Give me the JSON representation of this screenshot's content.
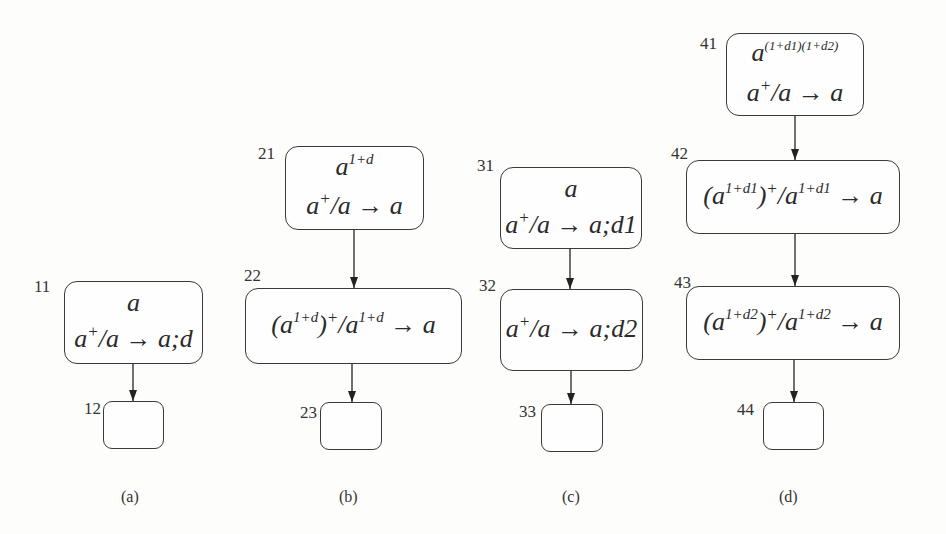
{
  "diagram": {
    "panels": [
      {
        "caption": "(a)",
        "nodes": [
          {
            "id": "11",
            "lines": [
              {
                "parts": [
                  {
                    "t": "a"
                  }
                ]
              },
              {
                "parts": [
                  {
                    "t": "a"
                  },
                  {
                    "sup": "+"
                  },
                  {
                    "t": "/a → a;d"
                  }
                ]
              }
            ]
          },
          {
            "id": "12",
            "lines": []
          }
        ],
        "edges": [
          [
            "11",
            "12"
          ]
        ]
      },
      {
        "caption": "(b)",
        "nodes": [
          {
            "id": "21",
            "lines": [
              {
                "parts": [
                  {
                    "t": "a"
                  },
                  {
                    "sup": "1+d"
                  }
                ]
              },
              {
                "parts": [
                  {
                    "t": "a"
                  },
                  {
                    "sup": "+"
                  },
                  {
                    "t": "/a → a"
                  }
                ]
              }
            ]
          },
          {
            "id": "22",
            "lines": [
              {
                "parts": [
                  {
                    "t": "(a"
                  },
                  {
                    "sup": "1+d"
                  },
                  {
                    "t": ")"
                  },
                  {
                    "sup": "+"
                  },
                  {
                    "t": "/a"
                  },
                  {
                    "sup": "1+d"
                  },
                  {
                    "t": " → a"
                  }
                ]
              }
            ]
          },
          {
            "id": "23",
            "lines": []
          }
        ],
        "edges": [
          [
            "21",
            "22"
          ],
          [
            "22",
            "23"
          ]
        ]
      },
      {
        "caption": "(c)",
        "nodes": [
          {
            "id": "31",
            "lines": [
              {
                "parts": [
                  {
                    "t": "a"
                  }
                ]
              },
              {
                "parts": [
                  {
                    "t": "a"
                  },
                  {
                    "sup": "+"
                  },
                  {
                    "t": "/a → a;d1"
                  }
                ]
              }
            ]
          },
          {
            "id": "32",
            "lines": [
              {
                "parts": [
                  {
                    "t": "a"
                  },
                  {
                    "sup": "+"
                  },
                  {
                    "t": "/a → a;d2"
                  }
                ]
              }
            ]
          },
          {
            "id": "33",
            "lines": []
          }
        ],
        "edges": [
          [
            "31",
            "32"
          ],
          [
            "32",
            "33"
          ]
        ]
      },
      {
        "caption": "(d)",
        "nodes": [
          {
            "id": "41",
            "lines": [
              {
                "parts": [
                  {
                    "t": "a"
                  },
                  {
                    "sup": "(1+d1)(1+d2)"
                  }
                ]
              },
              {
                "parts": [
                  {
                    "t": "a"
                  },
                  {
                    "sup": "+"
                  },
                  {
                    "t": "/a → a"
                  }
                ]
              }
            ]
          },
          {
            "id": "42",
            "lines": [
              {
                "parts": [
                  {
                    "t": "(a"
                  },
                  {
                    "sup": "1+d1"
                  },
                  {
                    "t": ")"
                  },
                  {
                    "sup": "+"
                  },
                  {
                    "t": "/a"
                  },
                  {
                    "sup": "1+d1"
                  },
                  {
                    "t": " → a"
                  }
                ]
              }
            ]
          },
          {
            "id": "43",
            "lines": [
              {
                "parts": [
                  {
                    "t": "(a"
                  },
                  {
                    "sup": "1+d2"
                  },
                  {
                    "t": ")"
                  },
                  {
                    "sup": "+"
                  },
                  {
                    "t": "/a"
                  },
                  {
                    "sup": "1+d2"
                  },
                  {
                    "t": " → a"
                  }
                ]
              }
            ]
          },
          {
            "id": "44",
            "lines": []
          }
        ],
        "edges": [
          [
            "41",
            "42"
          ],
          [
            "42",
            "43"
          ],
          [
            "43",
            "44"
          ]
        ]
      }
    ]
  },
  "labels": {
    "n11": "11",
    "n12": "12",
    "n21": "21",
    "n22": "22",
    "n23": "23",
    "n31": "31",
    "n32": "32",
    "n33": "33",
    "n41": "41",
    "n42": "42",
    "n43": "43",
    "n44": "44",
    "cap_a": "(a)",
    "cap_b": "(b)",
    "cap_c": "(c)",
    "cap_d": "(d)"
  },
  "text": {
    "n11_l1": "a",
    "n11_l2_a": "a",
    "n11_l2_sup": "+",
    "n11_l2_b": "/a → a;d",
    "n21_l1_a": "a",
    "n21_l1_sup": "1+d",
    "n21_l2_a": "a",
    "n21_l2_sup": "+",
    "n21_l2_b": "/a → a",
    "n22_a": "(a",
    "n22_sup1": "1+d",
    "n22_b": ")",
    "n22_sup2": "+",
    "n22_c": "/a",
    "n22_sup3": "1+d",
    "n22_d": " → a",
    "n31_l1": "a",
    "n31_l2_a": "a",
    "n31_l2_sup": "+",
    "n31_l2_b": "/a → a;d1",
    "n32_a": "a",
    "n32_sup": "+",
    "n32_b": "/a → a;d2",
    "n41_l1_a": "a",
    "n41_l1_sup": "(1+d1)(1+d2)",
    "n41_l2_a": "a",
    "n41_l2_sup": "+",
    "n41_l2_b": "/a → a",
    "n42_a": "(a",
    "n42_sup1": "1+d1",
    "n42_b": ")",
    "n42_sup2": "+",
    "n42_c": "/a",
    "n42_sup3": "1+d1",
    "n42_d": " → a",
    "n43_a": "(a",
    "n43_sup1": "1+d2",
    "n43_b": ")",
    "n43_sup2": "+",
    "n43_c": "/a",
    "n43_sup3": "1+d2",
    "n43_d": " → a"
  },
  "colors": {
    "stroke": "#3a3a3a",
    "background": "#fdfdfb"
  }
}
